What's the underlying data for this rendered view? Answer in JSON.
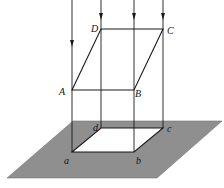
{
  "diagram": {
    "colors": {
      "plane": "#8f8f8f",
      "line": "#1a1a1a",
      "background": "#ffffff"
    },
    "upper_vertices": {
      "A": "A",
      "B": "B",
      "C": "C",
      "D": "D"
    },
    "projected_vertices": {
      "a": "a",
      "b": "b",
      "c": "c",
      "d": "d"
    }
  }
}
